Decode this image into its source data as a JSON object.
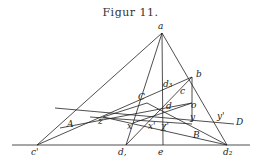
{
  "figure": {
    "title": "Figur 11.",
    "ink_color": "#222222"
  },
  "points": {
    "a": [
      162,
      33
    ],
    "b": [
      192,
      77
    ],
    "c_prime": [
      37,
      145
    ],
    "d1": [
      126,
      145
    ],
    "e": [
      163,
      145
    ],
    "d2": [
      227,
      145
    ],
    "C": [
      147,
      103
    ],
    "d": [
      173,
      105
    ],
    "o": [
      192,
      103
    ],
    "y": [
      192,
      122
    ],
    "y_prime": [
      215,
      122
    ],
    "z": [
      103,
      117
    ],
    "A": [
      72,
      117
    ],
    "x": [
      133,
      123
    ],
    "x_prime": [
      150,
      124
    ],
    "chi_prime": [
      163,
      124
    ],
    "d3": [
      163,
      88
    ]
  },
  "labels": [
    {
      "id": "a",
      "text": "a",
      "x": 158,
      "y": 22
    },
    {
      "id": "b",
      "text": "b",
      "x": 196,
      "y": 70
    },
    {
      "id": "d3",
      "text": "d₃",
      "x": 163,
      "y": 80
    },
    {
      "id": "c",
      "text": "c",
      "x": 180,
      "y": 87
    },
    {
      "id": "C",
      "text": "C",
      "x": 138,
      "y": 93
    },
    {
      "id": "d",
      "text": "d",
      "x": 166,
      "y": 102
    },
    {
      "id": "o",
      "text": "o",
      "x": 191,
      "y": 101
    },
    {
      "id": "y",
      "text": "y",
      "x": 190,
      "y": 113
    },
    {
      "id": "y_prime",
      "text": "y'",
      "x": 217,
      "y": 112
    },
    {
      "id": "D",
      "text": "D",
      "x": 236,
      "y": 118
    },
    {
      "id": "A",
      "text": "A",
      "x": 67,
      "y": 120
    },
    {
      "id": "z",
      "text": "z",
      "x": 98,
      "y": 117
    },
    {
      "id": "x",
      "text": "x",
      "x": 127,
      "y": 122
    },
    {
      "id": "x_prime",
      "text": "x'",
      "x": 148,
      "y": 122
    },
    {
      "id": "chi_prime",
      "text": "χ'",
      "x": 161,
      "y": 122
    },
    {
      "id": "B",
      "text": "B",
      "x": 193,
      "y": 131
    },
    {
      "id": "c_prime",
      "text": "c'",
      "x": 31,
      "y": 148
    },
    {
      "id": "d1",
      "text": "d,",
      "x": 118,
      "y": 148
    },
    {
      "id": "e",
      "text": "e",
      "x": 158,
      "y": 148
    },
    {
      "id": "d2",
      "text": "d₂",
      "x": 223,
      "y": 148
    }
  ],
  "lines": [
    {
      "name": "baseline",
      "from": [
        12,
        145
      ],
      "to": [
        250,
        145
      ]
    },
    {
      "name": "a-c_prime",
      "from": [
        162,
        33
      ],
      "to": [
        37,
        145
      ]
    },
    {
      "name": "a-d1",
      "from": [
        162,
        33
      ],
      "to": [
        126,
        145
      ]
    },
    {
      "name": "a-e",
      "from": [
        162,
        33
      ],
      "to": [
        163,
        145
      ]
    },
    {
      "name": "a-d2",
      "from": [
        162,
        33
      ],
      "to": [
        227,
        145
      ]
    },
    {
      "name": "c_prime-b",
      "from": [
        37,
        145
      ],
      "to": [
        192,
        77
      ]
    },
    {
      "name": "b-y",
      "from": [
        192,
        77
      ],
      "to": [
        192,
        122
      ]
    },
    {
      "name": "b-d1",
      "from": [
        192,
        77
      ],
      "to": [
        126,
        145
      ]
    },
    {
      "name": "line-D",
      "from": [
        55,
        108
      ],
      "to": [
        234,
        124
      ]
    },
    {
      "name": "z-d2",
      "from": [
        103,
        117
      ],
      "to": [
        227,
        145
      ]
    },
    {
      "name": "C-d2",
      "from": [
        147,
        103
      ],
      "to": [
        227,
        145
      ]
    },
    {
      "name": "z-o",
      "from": [
        60,
        128
      ],
      "to": [
        192,
        103
      ]
    },
    {
      "name": "z-C",
      "from": [
        103,
        117
      ],
      "to": [
        147,
        103
      ]
    },
    {
      "name": "x-d",
      "from": [
        133,
        123
      ],
      "to": [
        192,
        103
      ]
    },
    {
      "name": "line-zx",
      "from": [
        90,
        117
      ],
      "to": [
        192,
        124
      ]
    }
  ]
}
